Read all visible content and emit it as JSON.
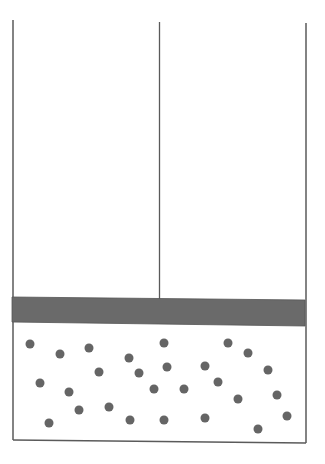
{
  "diagram": {
    "title": "Gas in cylinder with movable piston",
    "colors": {
      "background": "#ffffff",
      "wall": "#5a5a5a",
      "piston": "#6a6a6a",
      "particle": "#656565"
    },
    "cylinder": {
      "left_wall": {
        "x": 13,
        "y_top": 20,
        "y_bottom": 440
      },
      "right_wall": {
        "x": 306,
        "y_top": 23,
        "y_bottom": 443
      },
      "bottom": {
        "x1": 13,
        "y1": 440,
        "x2": 306,
        "y2": 443
      }
    },
    "piston_rod": {
      "x": 159.5,
      "y_top": 22,
      "y_bottom": 299
    },
    "piston": {
      "points": [
        [
          12,
          297
        ],
        [
          305,
          300
        ],
        [
          305,
          326
        ],
        [
          12,
          322
        ]
      ]
    },
    "particle_radius": 4.5,
    "particles": [
      {
        "x": 30,
        "y": 344
      },
      {
        "x": 60,
        "y": 354
      },
      {
        "x": 89,
        "y": 348
      },
      {
        "x": 129,
        "y": 358
      },
      {
        "x": 164,
        "y": 343
      },
      {
        "x": 228,
        "y": 343
      },
      {
        "x": 248,
        "y": 353
      },
      {
        "x": 99,
        "y": 372
      },
      {
        "x": 139,
        "y": 373
      },
      {
        "x": 167,
        "y": 367
      },
      {
        "x": 205,
        "y": 366
      },
      {
        "x": 268,
        "y": 370
      },
      {
        "x": 40,
        "y": 383
      },
      {
        "x": 69,
        "y": 392
      },
      {
        "x": 154,
        "y": 389
      },
      {
        "x": 184,
        "y": 389
      },
      {
        "x": 218,
        "y": 382
      },
      {
        "x": 238,
        "y": 399
      },
      {
        "x": 277,
        "y": 395
      },
      {
        "x": 79,
        "y": 410
      },
      {
        "x": 109,
        "y": 407
      },
      {
        "x": 49,
        "y": 423
      },
      {
        "x": 130,
        "y": 420
      },
      {
        "x": 164,
        "y": 420
      },
      {
        "x": 205,
        "y": 418
      },
      {
        "x": 287,
        "y": 416
      },
      {
        "x": 258,
        "y": 429
      }
    ]
  }
}
